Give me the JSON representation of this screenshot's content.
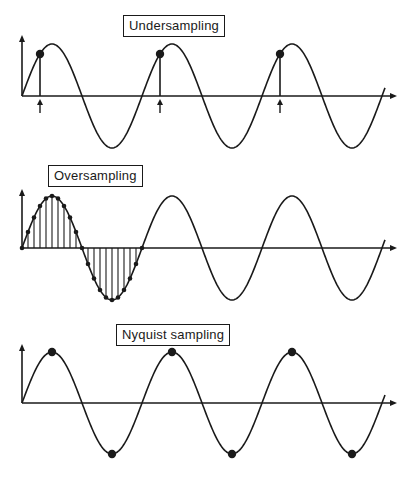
{
  "figure": {
    "width": 417,
    "height": 489,
    "stroke_color": "#1a1a1a",
    "background": "#ffffff"
  },
  "panels": [
    {
      "id": "undersampling",
      "label": "Undersampling",
      "label_box": {
        "left": 123,
        "top": 15,
        "width": 87,
        "height": 22
      },
      "axis_y": 96,
      "x_start": 22,
      "x_end": 385,
      "arrow_end_x": 397,
      "y_axis_top": 35,
      "amplitude": 52,
      "period": 120,
      "sampling": "under",
      "sample_x": [
        40,
        160,
        280
      ],
      "sample_markers": "stems-with-up-arrows-below-axis"
    },
    {
      "id": "oversampling",
      "label": "Oversampling",
      "label_box": {
        "left": 48,
        "top": 165,
        "width": 91,
        "height": 22
      },
      "axis_y": 248,
      "x_start": 22,
      "x_end": 385,
      "arrow_end_x": 397,
      "y_axis_top": 189,
      "amplitude": 52,
      "period": 120,
      "sampling": "over",
      "samples_per_period": 20,
      "sampled_periods": 1,
      "sample_markers": "stems-with-dots"
    },
    {
      "id": "nyquist",
      "label": "Nyquist sampling",
      "label_box": {
        "left": 116,
        "top": 324,
        "width": 110,
        "height": 22
      },
      "axis_y": 403,
      "x_start": 22,
      "x_end": 385,
      "arrow_end_x": 397,
      "y_axis_top": 344,
      "amplitude": 51,
      "period": 120,
      "sampling": "nyquist",
      "sample_x": [
        52,
        112,
        172,
        232,
        292,
        352
      ],
      "sample_markers": "dots-at-extrema"
    }
  ]
}
